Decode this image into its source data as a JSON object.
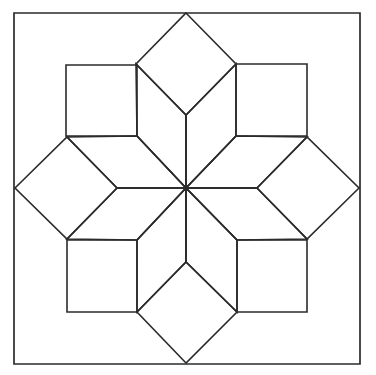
{
  "figure": {
    "canvas": {
      "width": 376,
      "height": 375
    },
    "colors": {
      "background": "#ffffff",
      "stroke": "#2b2b2b"
    },
    "stroke_width": 1.6,
    "center": {
      "x": 186,
      "y": 188
    },
    "frame": {
      "label": "outer-square-frame",
      "left": 14,
      "top": 13,
      "right": 360,
      "bottom": 364,
      "points": "14,13 360,13 360,364 14,364"
    },
    "diamonds": [
      {
        "name": "diamond-north",
        "points": "186,13 236,64 186,115 136,64"
      },
      {
        "name": "diamond-east",
        "points": "359,188 307,239 257,188 307,137"
      },
      {
        "name": "diamond-south",
        "points": "186,363 137,312 186,262 237,312"
      },
      {
        "name": "diamond-west",
        "points": "15,188 67,137 117,188 67,239"
      }
    ],
    "squares": [
      {
        "name": "square-northwest",
        "points": "66,65 137,65 137,136 66,136"
      },
      {
        "name": "square-northeast",
        "points": "236,64 307,64 307,136 236,136"
      },
      {
        "name": "square-southwest",
        "points": "67,240 137,240 137,312 67,312"
      },
      {
        "name": "square-southeast",
        "points": "237,240 307,240 307,312 237,312"
      }
    ],
    "rhombi": [
      {
        "name": "rhombus-north-west-of-axis",
        "points": "186,188 136,64 186,115 186,188"
      },
      {
        "name": "rhombus-north-axis-left",
        "points": "186,188 137,136 136,64 186,115"
      },
      {
        "name": "rhombus-north-axis-right",
        "points": "186,188 186,115 236,64 236,136"
      },
      {
        "name": "rhombus-west-upper",
        "points": "186,188 117,188 67,137 137,136"
      },
      {
        "name": "rhombus-west-lower",
        "points": "186,188 137,240 67,239 117,188"
      },
      {
        "name": "rhombus-east-upper",
        "points": "186,188 236,136 307,137 257,188"
      },
      {
        "name": "rhombus-east-lower",
        "points": "186,188 257,188 307,239 237,240"
      },
      {
        "name": "rhombus-south-left",
        "points": "186,188 137,240 137,312 186,262"
      },
      {
        "name": "rhombus-south-right",
        "points": "186,188 186,262 237,312 237,240"
      }
    ],
    "spokes": [
      {
        "name": "spoke-north",
        "x1": 186,
        "y1": 188,
        "x2": 186,
        "y2": 115
      },
      {
        "name": "spoke-northeast",
        "x1": 186,
        "y1": 188,
        "x2": 236,
        "y2": 136
      },
      {
        "name": "spoke-east",
        "x1": 186,
        "y1": 188,
        "x2": 257,
        "y2": 188
      },
      {
        "name": "spoke-southeast",
        "x1": 186,
        "y1": 188,
        "x2": 237,
        "y2": 240
      },
      {
        "name": "spoke-south",
        "x1": 186,
        "y1": 188,
        "x2": 186,
        "y2": 262
      },
      {
        "name": "spoke-southwest",
        "x1": 186,
        "y1": 188,
        "x2": 137,
        "y2": 240
      },
      {
        "name": "spoke-west",
        "x1": 186,
        "y1": 188,
        "x2": 117,
        "y2": 188
      },
      {
        "name": "spoke-northwest",
        "x1": 186,
        "y1": 188,
        "x2": 137,
        "y2": 136
      }
    ],
    "hub": {
      "name": "center-hub-dot",
      "x": 186,
      "y": 188,
      "r": 2.6
    }
  }
}
